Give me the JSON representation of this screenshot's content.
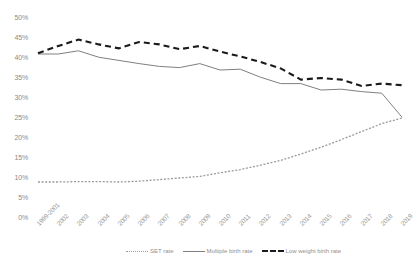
{
  "chart_data": {
    "type": "line",
    "title": "",
    "subtitle": "",
    "xlabel": "",
    "ylabel": "",
    "ylim": [
      0,
      50
    ],
    "ytick_labels": [
      "50%",
      "45%",
      "40%",
      "35%",
      "30%",
      "25%",
      "20%",
      "15%",
      "10%",
      "5%",
      "0%"
    ],
    "ytick_values": [
      50,
      45,
      40,
      35,
      30,
      25,
      20,
      15,
      10,
      5,
      0
    ],
    "grid": false,
    "legend_position": "bottom",
    "categories": [
      "1999-2001",
      "2002",
      "2003",
      "2004",
      "2005",
      "2006",
      "2007",
      "2008",
      "2009",
      "2010",
      "2011",
      "2012",
      "2013",
      "2014",
      "2015",
      "2016",
      "2017",
      "2018",
      "2019"
    ],
    "series": [
      {
        "name": "SET rate",
        "style": "dotted",
        "color": "#9a9a9a",
        "values": [
          9.0,
          9.0,
          9.1,
          9.1,
          9.0,
          9.2,
          9.6,
          10.0,
          10.4,
          11.3,
          12.1,
          13.2,
          14.4,
          16.0,
          17.7,
          19.6,
          21.6,
          23.6,
          25.0
        ]
      },
      {
        "name": "Multiple birth rate",
        "style": "solid",
        "color": "#808080",
        "values": [
          41.0,
          41.0,
          41.8,
          40.2,
          39.4,
          38.6,
          37.9,
          37.6,
          38.6,
          37.0,
          37.2,
          35.2,
          33.6,
          33.6,
          32.0,
          32.2,
          31.6,
          31.2,
          25.2
        ]
      },
      {
        "name": "Low weight birth rate",
        "style": "dashed",
        "color": "#1a1a1a",
        "values": [
          41.2,
          43.0,
          44.6,
          43.4,
          42.4,
          44.0,
          43.4,
          42.2,
          43.0,
          41.6,
          40.4,
          39.0,
          37.4,
          34.6,
          35.0,
          34.6,
          33.0,
          33.6,
          33.2
        ]
      }
    ]
  },
  "axes": {
    "plot_left": 38,
    "plot_right": 402,
    "plot_top": 18,
    "plot_bottom": 218
  }
}
